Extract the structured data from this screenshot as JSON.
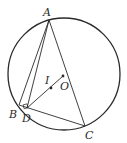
{
  "diagram": {
    "stroke_color": "#2a2a2a",
    "background": "#ffffff",
    "circle": {
      "cx": 64,
      "cy": 74,
      "r": 56
    },
    "points": {
      "A": {
        "label": "A",
        "x": 49,
        "y": 20,
        "lx": 43,
        "ly": 16
      },
      "B": {
        "label": "B",
        "x": 19,
        "y": 105,
        "lx": 9,
        "ly": 118
      },
      "C": {
        "label": "C",
        "x": 85,
        "y": 126,
        "lx": 85,
        "ly": 139
      },
      "D": {
        "label": "D",
        "x": 27,
        "y": 108,
        "lx": 22,
        "ly": 122
      },
      "I": {
        "label": "I",
        "x": 51,
        "y": 88,
        "lx": 45,
        "ly": 84
      },
      "O": {
        "label": "O",
        "x": 63,
        "y": 76,
        "lx": 60,
        "ly": 90
      }
    },
    "segments": [
      "AB",
      "AD",
      "AC",
      "BC",
      "DC",
      "DO"
    ],
    "right_angle_marker_at": "D"
  }
}
